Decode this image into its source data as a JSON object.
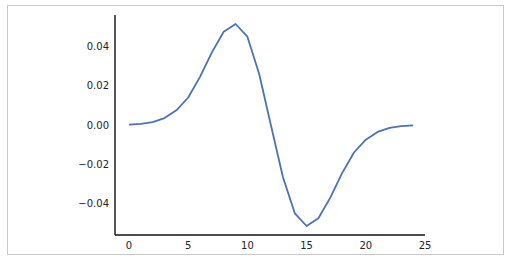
{
  "chart_data": {
    "type": "line",
    "title": "",
    "xlabel": "",
    "ylabel": "",
    "xlim": [
      -1.2,
      25
    ],
    "ylim": [
      -0.055,
      0.055
    ],
    "grid": false,
    "legend": null,
    "x_ticks": [
      0,
      5,
      10,
      15,
      20,
      25
    ],
    "x_tick_labels": [
      "0",
      "5",
      "10",
      "15",
      "20",
      "25"
    ],
    "y_ticks": [
      0.04,
      0.02,
      0.0,
      -0.02,
      -0.04
    ],
    "y_tick_labels": [
      "0.04",
      "0.02",
      "0.00",
      "−0.02",
      "−0.04"
    ],
    "series": [
      {
        "name": "series-1",
        "color": "#4c72b0",
        "x": [
          0,
          1,
          2,
          3,
          4,
          5,
          6,
          7,
          8,
          9,
          10,
          11,
          12,
          13,
          14,
          15,
          16,
          17,
          18,
          19,
          20,
          21,
          22,
          23,
          24
        ],
        "values": [
          0.0002,
          0.0006,
          0.0015,
          0.0035,
          0.0075,
          0.014,
          0.0245,
          0.037,
          0.0475,
          0.0515,
          0.045,
          0.026,
          -0.0005,
          -0.0265,
          -0.045,
          -0.0515,
          -0.0475,
          -0.037,
          -0.0245,
          -0.014,
          -0.0075,
          -0.0035,
          -0.0015,
          -0.0006,
          -0.0002
        ]
      }
    ]
  }
}
